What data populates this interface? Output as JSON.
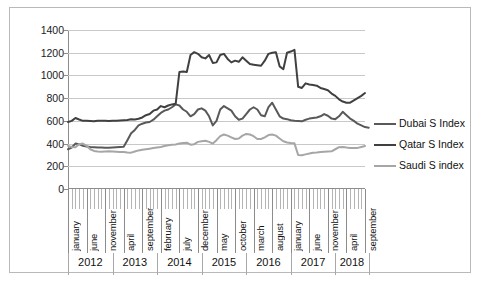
{
  "chart_data": {
    "type": "line",
    "title": "",
    "xlabel": "",
    "ylabel": "",
    "ylim": [
      0,
      1400
    ],
    "ytick_step": 200,
    "yticks": [
      0,
      200,
      400,
      600,
      800,
      1000,
      1200,
      1400
    ],
    "grid": true,
    "legend_position": "right",
    "x_major_labels": [
      "january",
      "june",
      "november",
      "april",
      "september",
      "february",
      "july",
      "december",
      "may",
      "october",
      "march",
      "august",
      "january",
      "june",
      "november",
      "april",
      "september"
    ],
    "x_major_label_interval": 5,
    "year_groups": [
      {
        "label": "2012",
        "months": 12
      },
      {
        "label": "2013",
        "months": 12
      },
      {
        "label": "2014",
        "months": 12
      },
      {
        "label": "2015",
        "months": 12
      },
      {
        "label": "2016",
        "months": 12
      },
      {
        "label": "2017",
        "months": 12
      },
      {
        "label": "2018",
        "months": 9
      }
    ],
    "n_points": 81,
    "series": [
      {
        "name": "Dubai S Index",
        "color": "#595959",
        "width": 2,
        "values": [
          350,
          365,
          400,
          395,
          380,
          375,
          370,
          368,
          366,
          365,
          364,
          364,
          366,
          368,
          370,
          372,
          430,
          490,
          520,
          560,
          575,
          585,
          590,
          610,
          640,
          670,
          690,
          700,
          720,
          745,
          735,
          700,
          680,
          640,
          660,
          700,
          710,
          690,
          640,
          560,
          600,
          700,
          730,
          710,
          690,
          640,
          610,
          620,
          660,
          700,
          720,
          700,
          650,
          640,
          720,
          760,
          700,
          640,
          620,
          615,
          605,
          600,
          598,
          596,
          610,
          620,
          625,
          630,
          640,
          660,
          645,
          620,
          615,
          640,
          680,
          650,
          620,
          600,
          575,
          560,
          545,
          540
        ]
      },
      {
        "name": "Qatar S Index",
        "color": "#404040",
        "width": 2,
        "values": [
          590,
          600,
          625,
          612,
          600,
          600,
          598,
          596,
          600,
          602,
          600,
          598,
          600,
          602,
          604,
          606,
          608,
          615,
          612,
          618,
          630,
          650,
          660,
          690,
          700,
          730,
          720,
          735,
          745,
          750,
          1030,
          1035,
          1030,
          1180,
          1205,
          1190,
          1160,
          1150,
          1180,
          1110,
          1115,
          1180,
          1190,
          1145,
          1115,
          1130,
          1120,
          1160,
          1130,
          1100,
          1095,
          1090,
          1085,
          1130,
          1190,
          1200,
          1205,
          1080,
          1055,
          1200,
          1210,
          1225,
          900,
          890,
          930,
          920,
          915,
          910,
          890,
          880,
          870,
          840,
          820,
          790,
          770,
          760,
          760,
          780,
          800,
          820,
          845
        ]
      },
      {
        "name": "Saudi S index",
        "color": "#a6a6a6",
        "width": 2,
        "values": [
          380,
          370,
          368,
          395,
          400,
          380,
          350,
          335,
          330,
          328,
          330,
          332,
          330,
          328,
          326,
          325,
          322,
          320,
          330,
          340,
          345,
          350,
          355,
          360,
          365,
          370,
          378,
          385,
          390,
          392,
          400,
          405,
          408,
          390,
          395,
          415,
          420,
          425,
          415,
          400,
          430,
          465,
          480,
          470,
          455,
          440,
          445,
          470,
          485,
          480,
          465,
          440,
          440,
          455,
          475,
          480,
          470,
          445,
          420,
          410,
          405,
          402,
          300,
          298,
          305,
          312,
          320,
          322,
          325,
          328,
          330,
          332,
          350,
          368,
          370,
          365,
          362,
          360,
          362,
          370,
          378
        ]
      }
    ]
  },
  "legend": {
    "items": [
      {
        "label": "Dubai S Index"
      },
      {
        "label": "Qatar S Index"
      },
      {
        "label": "Saudi S index"
      }
    ]
  }
}
